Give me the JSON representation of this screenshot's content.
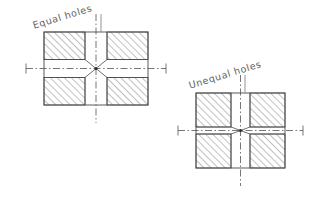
{
  "page": {
    "background_color": "#ffffff",
    "line_color": "#4a4a4a",
    "hatch_color": "#6b6b6b",
    "text_color": "#5e5e5e",
    "width": 320,
    "height": 201
  },
  "figures": [
    {
      "id": "equal-holes",
      "label": "Equal holes",
      "box": {
        "x": 44,
        "y": 32,
        "width": 104,
        "height": 73
      },
      "void": {
        "vertical_gap": 22,
        "horizontal_gap": 18
      },
      "center": {
        "x": 96,
        "y": 68.5
      },
      "leader": {
        "x": 101,
        "y_top": 14,
        "y_bottom": 32
      },
      "centerline_overshoot": 18,
      "hatch_angle_deg": 45,
      "quadrant_count": 4
    },
    {
      "id": "unequal-holes",
      "label": "Unequal holes",
      "box": {
        "x": 196,
        "y": 93,
        "width": 89,
        "height": 75
      },
      "void": {
        "vertical_gap": 19,
        "horizontal_gap": 7
      },
      "center": {
        "x": 240.5,
        "y": 130.5
      },
      "leader": {
        "x": 245,
        "y_top": 75,
        "y_bottom": 93
      },
      "centerline_overshoot": 18,
      "hatch_angle_deg": 45,
      "quadrant_count": 4
    }
  ]
}
